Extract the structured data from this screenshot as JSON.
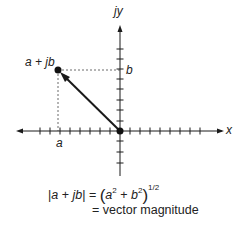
{
  "diagram": {
    "axes": {
      "x_label": "x",
      "y_label": "jy"
    },
    "point": {
      "label": "a + jb",
      "x_label": "a",
      "y_label": "b"
    },
    "formula": {
      "lhs_open": "|",
      "lhs_a": "a",
      "lhs_plus": " + ",
      "lhs_jb": "jb",
      "lhs_close": "|",
      "equals": " = ",
      "rhs_a": "a",
      "rhs_a_exp": "2",
      "rhs_plus": " + ",
      "rhs_b": "b",
      "rhs_b_exp": "2",
      "rhs_exp": "1/2",
      "line2": "= vector magnitude"
    },
    "colors": {
      "ink": "#1a1a1a",
      "dashed": "#444444"
    }
  }
}
